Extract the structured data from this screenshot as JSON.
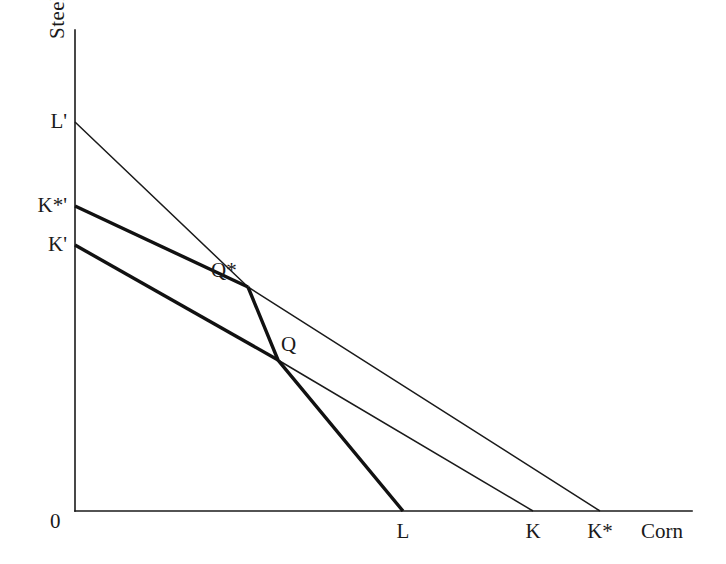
{
  "figure": {
    "background_color": "#ffffff",
    "ink_color": "#1a1a1a"
  },
  "axes": {
    "y_axis_label": "Steel",
    "x_axis_label": "Corn",
    "origin_label": "0"
  },
  "intercept_labels": {
    "l_prime": "L'",
    "k_star_prime": "K*'",
    "k_prime": "K'",
    "l": "L",
    "k": "K",
    "k_star": "K*"
  },
  "point_labels": {
    "q_star": "Q*",
    "q": "Q"
  },
  "chart_data": {
    "type": "line",
    "xlabel": "Corn",
    "ylabel": "Steel",
    "grid": false,
    "legend": "none",
    "axis_origin": {
      "x": 75,
      "y": 511
    },
    "y_axis_top": 30,
    "x_axis_right": 692,
    "xlim": [
      0,
      692
    ],
    "ylim": [
      0,
      511
    ],
    "annotations": [
      {
        "label": "L'",
        "x": 75,
        "y": 122,
        "role": "y-intercept",
        "anchor": "right"
      },
      {
        "label": "K*'",
        "x": 75,
        "y": 206,
        "role": "y-intercept",
        "anchor": "right"
      },
      {
        "label": "K'",
        "x": 75,
        "y": 245,
        "role": "y-intercept",
        "anchor": "right"
      },
      {
        "label": "L",
        "x": 403,
        "y": 511,
        "role": "x-intercept",
        "anchor": "center"
      },
      {
        "label": "K",
        "x": 533,
        "y": 511,
        "role": "x-intercept",
        "anchor": "center"
      },
      {
        "label": "K*",
        "x": 600,
        "y": 511,
        "role": "x-intercept",
        "anchor": "center"
      },
      {
        "label": "Q*",
        "x": 248,
        "y": 287,
        "role": "intersection-point",
        "anchor": "upper-right"
      },
      {
        "label": "Q",
        "x": 278,
        "y": 360,
        "role": "intersection-point",
        "anchor": "upper-right"
      }
    ],
    "series": [
      {
        "name": "L'-K* labour constraint (thin)",
        "weight": "thin",
        "points": [
          [
            75,
            122
          ],
          [
            248,
            287
          ],
          [
            600,
            511
          ]
        ]
      },
      {
        "name": "K*'-Q* capital constraint (thick)",
        "weight": "thick",
        "points": [
          [
            75,
            206
          ],
          [
            248,
            287
          ]
        ]
      },
      {
        "name": "Q*-Q-L efficient frontier segment (thick)",
        "weight": "thick",
        "points": [
          [
            248,
            287
          ],
          [
            278,
            360
          ],
          [
            403,
            511
          ]
        ]
      },
      {
        "name": "K'-Q capital constraint (thick)",
        "weight": "thick",
        "points": [
          [
            75,
            245
          ],
          [
            278,
            360
          ]
        ]
      },
      {
        "name": "Q-K constraint continuation (thin)",
        "weight": "thin",
        "points": [
          [
            278,
            360
          ],
          [
            533,
            511
          ]
        ]
      }
    ]
  }
}
